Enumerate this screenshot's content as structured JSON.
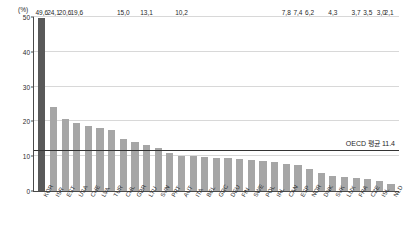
{
  "chart_data": {
    "type": "bar",
    "title": "",
    "subtitle": "",
    "xlabel": "",
    "ylabel": "(%)",
    "ylim": [
      0,
      50
    ],
    "yticks": [
      0,
      10,
      20,
      30,
      40,
      50
    ],
    "ytick_labels": [
      "0",
      "10",
      "20",
      "30",
      "40",
      "50"
    ],
    "grid": true,
    "legend": null,
    "categories": [
      "KOR",
      "ISR",
      "EST",
      "USA",
      "CHE",
      "LVA",
      "TUR",
      "CHL",
      "GBR",
      "LTU",
      "SVN",
      "PRT",
      "AUT",
      "ITA",
      "BEL",
      "GRC",
      "DEU",
      "FIN",
      "SWE",
      "POL",
      "IRL",
      "CAN",
      "ESP",
      "NOR",
      "DNK",
      "SVK",
      "LUX",
      "FRA",
      "CZE",
      "ISL",
      "NLD"
    ],
    "values": [
      49.6,
      24.1,
      20.6,
      19.6,
      18.6,
      18.2,
      17.6,
      15.0,
      14.2,
      13.1,
      12.4,
      11.0,
      10.2,
      10.0,
      9.8,
      9.6,
      9.4,
      9.2,
      9.0,
      8.6,
      8.2,
      7.8,
      7.4,
      6.2,
      5.2,
      4.3,
      4.0,
      3.7,
      3.5,
      3.0,
      2.1
    ],
    "labeled_values": {
      "0": "49,6",
      "1": "24,1",
      "2": "20,6",
      "3": "19,6",
      "7": "15,0",
      "9": "13,1",
      "12": "10,2",
      "21": "7,8",
      "22": "7,4",
      "23": "6,2",
      "25": "4,3",
      "27": "3,7",
      "28": "3,5",
      "29": "3,0",
      "30": "2,1"
    },
    "highlight_category": "KOR",
    "annotations": [
      {
        "name": "oecd-average-line",
        "label": "OECD 평균 11.4",
        "value": 11.4
      }
    ],
    "colors": {
      "bar": "#a6a6a6",
      "bar_highlight": "#595959",
      "axis": "#4a4a4a",
      "grid": "#d8d8d8",
      "average_line": "#333333",
      "text": "#1f1f1f"
    }
  }
}
